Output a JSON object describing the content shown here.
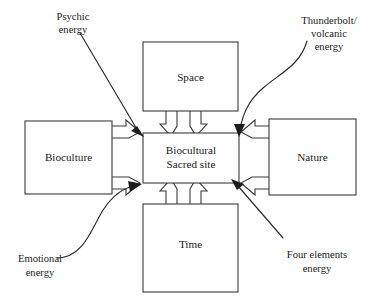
{
  "diagram": {
    "stroke_color": "#3a3a3a",
    "text_color": "#1b1b1b",
    "background_color": "#ffffff",
    "center_node": {
      "name": "biocultural-sacred-site",
      "line1": "Biocultural",
      "line2": "Sacred site"
    },
    "nodes": [
      {
        "name": "space",
        "label": "Space",
        "position": "top"
      },
      {
        "name": "time",
        "label": "Time",
        "position": "bottom"
      },
      {
        "name": "bioculture",
        "label": "Bioculture",
        "position": "left"
      },
      {
        "name": "nature",
        "label": "Nature",
        "position": "right"
      }
    ],
    "annotations": [
      {
        "name": "psychic-energy",
        "line1": "Psychic",
        "line2": "energy",
        "position": "top-left",
        "arrow": "straight"
      },
      {
        "name": "thunderbolt-volcanic-energy",
        "line1": "Thunderbolt/",
        "line2": "volcanic",
        "line3": "energy",
        "position": "top-right",
        "arrow": "curved"
      },
      {
        "name": "emotional-energy",
        "line1": "Emotional",
        "line2": "energy",
        "position": "bottom-left",
        "arrow": "curved"
      },
      {
        "name": "four-elements-energy",
        "line1": "Four elements",
        "line2": "energy",
        "position": "bottom-right",
        "arrow": "straight"
      }
    ]
  }
}
